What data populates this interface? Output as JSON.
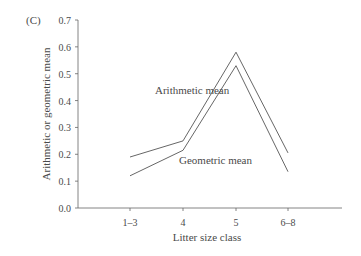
{
  "panel_label": "(C)",
  "chart_data": {
    "type": "line",
    "title": "",
    "xlabel": "Litter size class",
    "ylabel": "Arithmetic or geometric mean",
    "categories": [
      "1–3",
      "4",
      "5",
      "6–8"
    ],
    "series": [
      {
        "name": "Arithmetic mean",
        "values": [
          0.19,
          0.25,
          0.58,
          0.205
        ]
      },
      {
        "name": "Geometric mean",
        "values": [
          0.12,
          0.215,
          0.53,
          0.135
        ]
      }
    ],
    "ylim": [
      0.0,
      0.7
    ],
    "yticks": [
      "0.0",
      "0.1",
      "0.2",
      "0.3",
      "0.4",
      "0.5",
      "0.6",
      "0.7"
    ],
    "grid": false,
    "legend": "inline labels"
  }
}
